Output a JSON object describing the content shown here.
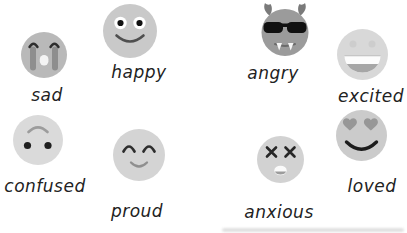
{
  "emotions": [
    {
      "label": "sad",
      "icon": "crying-face"
    },
    {
      "label": "happy",
      "icon": "smiling-face"
    },
    {
      "label": "angry",
      "icon": "devil-face-with-sunglasses"
    },
    {
      "label": "excited",
      "icon": "grinning-open-mouth-face"
    },
    {
      "label": "confused",
      "icon": "upside-down-face"
    },
    {
      "label": "proud",
      "icon": "smiling-face-closed-eyes"
    },
    {
      "label": "anxious",
      "icon": "dizzy-face-x-eyes"
    },
    {
      "label": "loved",
      "icon": "heart-eyes-face"
    }
  ],
  "colors": {
    "background": "#ffffff",
    "sad_face": "#b9b9b9",
    "tears": "#8e8e8e",
    "happy_face": "#c9c9c9",
    "angry_face": "#9b9b9b",
    "horns": "#7a7a7a",
    "sunglasses": "#101010",
    "excited_face": "#d8d8d8",
    "confused_face": "#dadada",
    "proud_face": "#d4d4d4",
    "anxious_face": "#d2d2d2",
    "loved_face": "#cbcbcb",
    "heart_gray": "#979797",
    "feature_dark": "#2a2a2a",
    "label_text": "#222222"
  }
}
